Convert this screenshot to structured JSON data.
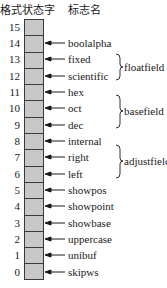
{
  "header": {
    "left": "格式状态字",
    "right": "标志名"
  },
  "bits": [
    {
      "bit": "15",
      "flag": ""
    },
    {
      "bit": "14",
      "flag": "boolalpha"
    },
    {
      "bit": "13",
      "flag": "fixed"
    },
    {
      "bit": "12",
      "flag": "scientific"
    },
    {
      "bit": "11",
      "flag": "hex"
    },
    {
      "bit": "10",
      "flag": "oct"
    },
    {
      "bit": "9",
      "flag": "dec"
    },
    {
      "bit": "8",
      "flag": "internal"
    },
    {
      "bit": "7",
      "flag": "right"
    },
    {
      "bit": "6",
      "flag": "left"
    },
    {
      "bit": "5",
      "flag": "showpos"
    },
    {
      "bit": "4",
      "flag": "showpoint"
    },
    {
      "bit": "3",
      "flag": "showbase"
    },
    {
      "bit": "2",
      "flag": "uppercase"
    },
    {
      "bit": "1",
      "flag": "unibuf"
    },
    {
      "bit": "0",
      "flag": "skipws"
    }
  ],
  "groups": [
    {
      "name": "floatfield",
      "bits": [
        "13",
        "12"
      ]
    },
    {
      "name": "basefield",
      "bits": [
        "11",
        "10",
        "9"
      ]
    },
    {
      "name": "adjustfield",
      "bits": [
        "8",
        "7",
        "6"
      ]
    }
  ],
  "colors": {
    "cell_fill": "#c8c8c8",
    "border": "#3a3a3a",
    "text": "#1a1a1a"
  }
}
